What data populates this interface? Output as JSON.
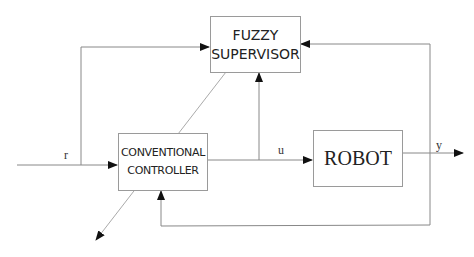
{
  "diagram": {
    "type": "block-diagram",
    "blocks": {
      "supervisor": {
        "line1": "FUZZY",
        "line2": "SUPERVISOR"
      },
      "controller": {
        "line1": "CONVENTIONAL",
        "line2": "CONTROLLER"
      },
      "robot": {
        "label": "ROBOT"
      }
    },
    "signals": {
      "reference": "r",
      "control": "u",
      "output": "y"
    },
    "colors": {
      "line": "#888888",
      "arrow": "#111111",
      "text": "#222222"
    }
  }
}
